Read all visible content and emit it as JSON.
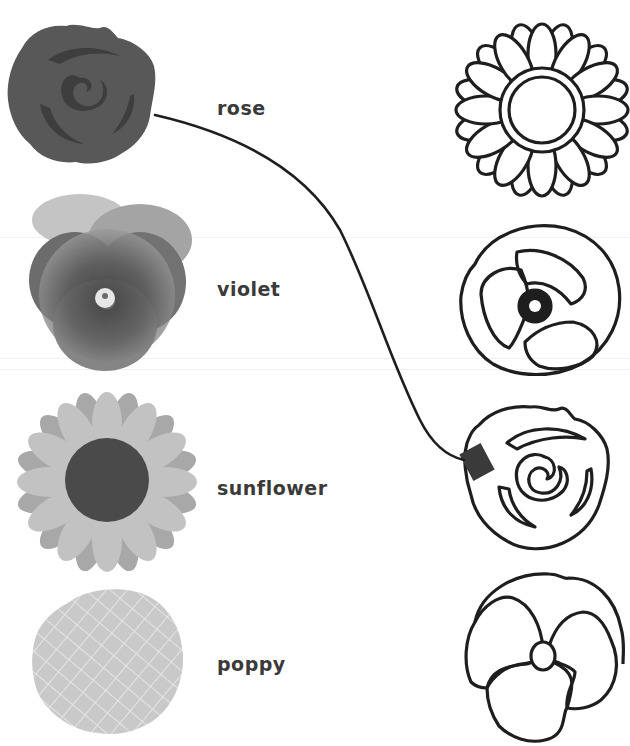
{
  "worksheet": {
    "type": "matching",
    "left_items": [
      {
        "name": "rose",
        "label": "rose",
        "image": "filled-rose-icon"
      },
      {
        "name": "violet",
        "label": "violet",
        "image": "violet-photo"
      },
      {
        "name": "sunflower",
        "label": "sunflower",
        "image": "filled-sunflower-icon"
      },
      {
        "name": "poppy",
        "label": "poppy",
        "image": "crosshatch-poppy-icon"
      }
    ],
    "right_items": [
      {
        "name": "sunflower-outline",
        "image": "sunflower-outline-icon"
      },
      {
        "name": "poppy-outline",
        "image": "poppy-outline-icon"
      },
      {
        "name": "rose-outline",
        "image": "rose-outline-icon"
      },
      {
        "name": "violet-outline",
        "image": "violet-outline-icon"
      }
    ],
    "connections": [
      {
        "from": "rose",
        "to": "rose-outline"
      }
    ],
    "colors": {
      "rose_fill": "#585858",
      "rose_inner": "#3e3e3e",
      "sunflower_petal_light": "#bdbdbd",
      "sunflower_petal_dark": "#a8a8a8",
      "sunflower_center": "#4a4a4a",
      "poppy_fill": "#c9c9c9",
      "outline": "#1e1e1e",
      "label_text": "#3a3a3a"
    }
  }
}
